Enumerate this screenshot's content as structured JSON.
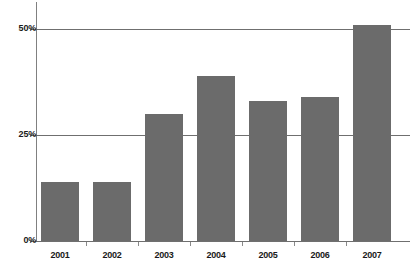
{
  "chart_data": {
    "type": "bar",
    "title": "",
    "subtitle": "",
    "xlabel": "",
    "ylabel": "",
    "categories": [
      "2001",
      "2002",
      "2003",
      "2004",
      "2005",
      "2006",
      "2007"
    ],
    "values": [
      14,
      14,
      30,
      39,
      33,
      34,
      51
    ],
    "value_labels": [
      "14%",
      "14%",
      "30%",
      "39%",
      "33%",
      "34%",
      "51%"
    ],
    "ylim": [
      0,
      55
    ],
    "y_ticks": [
      0,
      25,
      50
    ],
    "y_tick_labels": [
      "0%",
      "25%",
      "50%"
    ],
    "grid": true,
    "grid_axis": "y",
    "legend": false,
    "legend_position": "none",
    "series": [
      {
        "name": "",
        "values": [
          14,
          14,
          30,
          39,
          33,
          34,
          51
        ]
      }
    ],
    "colors": {
      "bar_fill": "#6b6b6b",
      "axis": "#6f6f6f",
      "gridline": "#6f6f6f",
      "text": "#1a1a1a",
      "background": "#ffffff"
    }
  },
  "axis": {
    "y_labels": [
      {
        "text": "50%",
        "value": 50
      },
      {
        "text": "25%",
        "value": 25
      },
      {
        "text": "0%",
        "value": 0
      }
    ],
    "x_labels": [
      {
        "text": "2001"
      },
      {
        "text": "2002"
      },
      {
        "text": "2003"
      },
      {
        "text": "2004"
      },
      {
        "text": "2005"
      },
      {
        "text": "2006"
      },
      {
        "text": "2007"
      }
    ]
  }
}
